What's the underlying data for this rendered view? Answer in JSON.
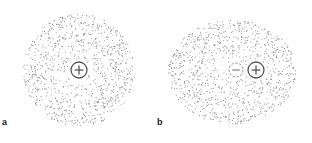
{
  "panels": [
    {
      "label": "a",
      "description": "Electron cloud symmetric around nucleus",
      "cloud": {
        "cx": 79,
        "cy": 70,
        "rx": 56,
        "ry": 56,
        "hole": 10,
        "count": 900
      },
      "charges": [
        {
          "type": "positive",
          "symbol": "+",
          "cx": 79,
          "cy": 70,
          "r": 8,
          "dashed": false
        }
      ]
    },
    {
      "label": "b",
      "description": "Distorted electron cloud with induced dipole",
      "cloud": {
        "cx": 232,
        "cy": 72,
        "rx": 64,
        "ry": 52,
        "hole": 22,
        "count": 950
      },
      "charges": [
        {
          "type": "negative",
          "symbol": "−",
          "cx": 236,
          "cy": 70,
          "r": 7,
          "dashed": true
        },
        {
          "type": "positive",
          "symbol": "+",
          "cx": 256,
          "cy": 70,
          "r": 8,
          "dashed": false
        }
      ]
    }
  ],
  "colors": {
    "dots": "#8a8a8a",
    "charge_stroke": "#555555",
    "dashed_stroke": "#8f8f8f"
  }
}
